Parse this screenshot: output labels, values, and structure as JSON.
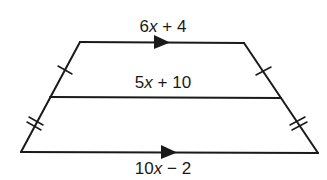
{
  "figure": {
    "type": "trapezoid-with-midsegment",
    "labels": {
      "top_base": {
        "coef": "6",
        "var": "x",
        "rest": " + 4"
      },
      "midsegment": {
        "coef": "5",
        "var": "x",
        "rest": " + 10"
      },
      "bottom_base": {
        "coef": "10",
        "var": "x",
        "rest": " − 2"
      }
    },
    "markings": {
      "parallel_arrows": [
        "top_base",
        "bottom_base"
      ],
      "single_tick": [
        "left_upper_leg",
        "right_upper_leg"
      ],
      "double_tick": [
        "left_lower_leg",
        "right_lower_leg"
      ]
    },
    "colors": {
      "stroke": "#1a1a1a",
      "background": "#ffffff"
    }
  }
}
